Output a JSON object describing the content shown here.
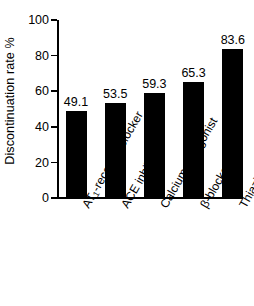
{
  "chart_data": {
    "type": "bar",
    "title": "",
    "subtitle": "",
    "xlabel": "",
    "ylabel": "Discontinuation rate %",
    "categories": [
      "AT1-receptor blocker",
      "ACE inhibitor",
      "Calcium antagonist",
      "β-blocker",
      "Thiazide diuretic"
    ],
    "category_labels_html": [
      "AT<sub>1</sub>-receptor blocker",
      "ACE inhibitor",
      "Calcium antagonist",
      "β-blocker",
      "Thiazide diuretic"
    ],
    "values": [
      49.1,
      53.5,
      59.3,
      65.3,
      83.6
    ],
    "value_labels": [
      "49.1",
      "53.5",
      "59.3",
      "65.3",
      "83.6"
    ],
    "ylim": [
      0,
      100
    ],
    "yticks": [
      0,
      20,
      40,
      60,
      80,
      100
    ],
    "ytick_labels": [
      "0",
      "20",
      "40",
      "60",
      "80",
      "100"
    ],
    "grid": false,
    "legend": false,
    "bar_color": "#000000",
    "background_color": "#ffffff",
    "axis_color": "#000000"
  }
}
